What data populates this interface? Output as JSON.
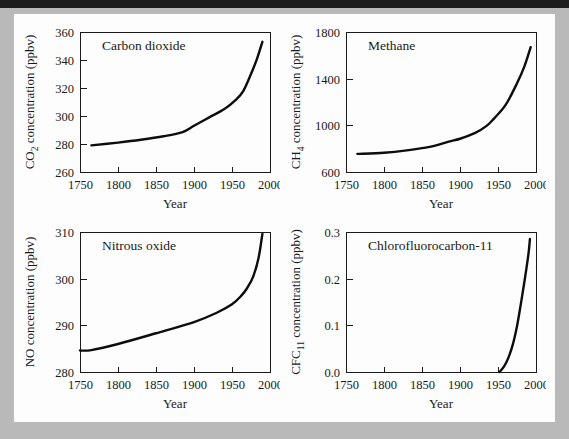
{
  "figure": {
    "background_color": "#b9b9b9",
    "page_color": "#fdfdfd",
    "curve_color": "#0d0d0d",
    "axis_color": "#1a1a1a"
  },
  "chart_data": [
    {
      "type": "line",
      "title": "Carbon dioxide",
      "xlabel": "Year",
      "ylabel": "CO2 concentration (ppbv)",
      "ylabel_prefix": "CO",
      "ylabel_sub": "2",
      "ylabel_suffix": " concentration (ppbv)",
      "xlim": [
        1750,
        2000
      ],
      "ylim": [
        260,
        360
      ],
      "xticks": [
        1750,
        1800,
        1850,
        1900,
        1950,
        2000
      ],
      "yticks": [
        260,
        280,
        300,
        320,
        340,
        360
      ],
      "xtick_labels": [
        "1750",
        "1800",
        "1850",
        "1900",
        "1950",
        "2000"
      ],
      "ytick_labels": [
        "260",
        "280",
        "300",
        "320",
        "340",
        "360"
      ],
      "grid": false,
      "legend": "none",
      "x": [
        1765,
        1800,
        1830,
        1860,
        1885,
        1900,
        1920,
        1940,
        1955,
        1965,
        1975,
        1983,
        1990
      ],
      "values": [
        279,
        281,
        283,
        285.5,
        288.5,
        293,
        299,
        305,
        311.5,
        318,
        330,
        341,
        353
      ]
    },
    {
      "type": "line",
      "title": "Methane",
      "xlabel": "Year",
      "ylabel": "CH4 concentration (ppbv)",
      "ylabel_prefix": "CH",
      "ylabel_sub": "4",
      "ylabel_suffix": " concentration (ppbv)",
      "xlim": [
        1750,
        2000
      ],
      "ylim": [
        600,
        1800
      ],
      "xticks": [
        1750,
        1800,
        1850,
        1900,
        1950,
        2000
      ],
      "yticks": [
        600,
        1000,
        1400,
        1800
      ],
      "xtick_labels": [
        "600",
        "1000",
        "1400",
        "1800"
      ],
      "ytick_labels": [
        "600",
        "1000",
        "1400",
        "1800"
      ],
      "grid": false,
      "legend": "none",
      "x": [
        1765,
        1800,
        1830,
        1860,
        1885,
        1900,
        1920,
        1935,
        1945,
        1960,
        1975,
        1985,
        1993
      ],
      "values": [
        755,
        765,
        785,
        815,
        860,
        885,
        935,
        995,
        1060,
        1175,
        1360,
        1510,
        1670
      ]
    },
    {
      "type": "line",
      "title": "Nitrous oxide",
      "xlabel": "Year",
      "ylabel": "NO concentration (ppbv)",
      "ylabel_prefix": "NO",
      "ylabel_sub": "",
      "ylabel_suffix": " concentration (ppbv)",
      "xlim": [
        1750,
        2000
      ],
      "ylim": [
        280,
        310
      ],
      "xticks": [
        1750,
        1800,
        1850,
        1900,
        1950,
        2000
      ],
      "yticks": [
        280,
        290,
        300,
        310
      ],
      "xtick_labels": [
        "1750",
        "1800",
        "1850",
        "1900",
        "1950",
        "2000"
      ],
      "ytick_labels": [
        "280",
        "290",
        "300",
        "310"
      ],
      "grid": false,
      "legend": "none",
      "x": [
        1750,
        1765,
        1800,
        1850,
        1900,
        1930,
        1950,
        1962,
        1970,
        1978,
        1985,
        1990
      ],
      "values": [
        284.6,
        284.7,
        286,
        288.3,
        290.7,
        292.7,
        294.5,
        296.3,
        298,
        300.5,
        304.5,
        309.6
      ]
    },
    {
      "type": "line",
      "title": "Chlorofluorocarbon-11",
      "xlabel": "Year",
      "ylabel": "CFC11 concentration (ppbv)",
      "ylabel_prefix": "CFC",
      "ylabel_sub": "11",
      "ylabel_suffix": " concentration (ppbv)",
      "xlim": [
        1750,
        2000
      ],
      "ylim": [
        0.0,
        0.3
      ],
      "xticks": [
        1750,
        1800,
        1850,
        1900,
        1950,
        2000
      ],
      "yticks": [
        0.0,
        0.1,
        0.2,
        0.3
      ],
      "xtick_labels": [
        "1750",
        "1800",
        "1850",
        "1900",
        "1950",
        "2000"
      ],
      "ytick_labels": [
        "0.0",
        "0.1",
        "0.2",
        "0.3"
      ],
      "grid": false,
      "legend": "none",
      "x": [
        1952,
        1958,
        1964,
        1970,
        1975,
        1980,
        1985,
        1990,
        1992
      ],
      "values": [
        0.0,
        0.012,
        0.032,
        0.062,
        0.098,
        0.145,
        0.196,
        0.252,
        0.285
      ]
    }
  ]
}
